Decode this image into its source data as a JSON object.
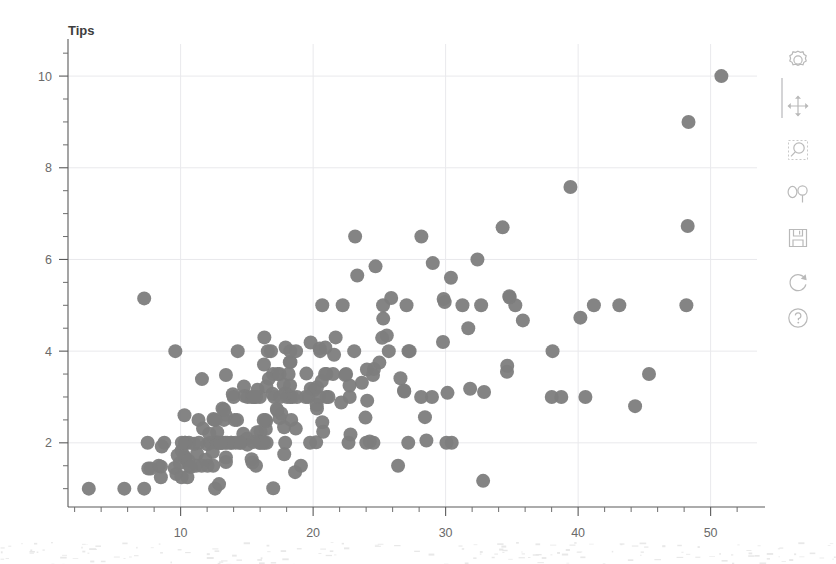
{
  "window": {
    "background_color": "#ffffff"
  },
  "chart_data": {
    "type": "scatter",
    "title": "",
    "ylabel": "Tips",
    "xlabel": "",
    "grid": true,
    "legend": "none",
    "marker": {
      "shape": "circle",
      "color": "#7d7d7d",
      "radius_px": 7
    },
    "xlim": [
      1.5,
      53.5
    ],
    "ylim": [
      0.6,
      10.7
    ],
    "xticks": [
      10,
      20,
      30,
      40,
      50
    ],
    "xtick_labels": [
      "10",
      "20",
      "30",
      "40",
      "50"
    ],
    "x_minor_step": 2,
    "yticks": [
      2,
      4,
      6,
      8,
      10
    ],
    "ytick_labels": [
      "2",
      "4",
      "6",
      "8",
      "10"
    ],
    "y_minor_step": 0.5,
    "series": [
      {
        "name": "tips",
        "x": [
          16.99,
          10.34,
          21.01,
          23.68,
          24.59,
          25.29,
          8.77,
          26.88,
          15.04,
          14.78,
          10.27,
          35.26,
          15.42,
          18.43,
          14.83,
          21.58,
          10.33,
          16.29,
          16.97,
          20.65,
          17.92,
          20.29,
          15.77,
          39.42,
          19.82,
          17.81,
          13.37,
          12.69,
          21.7,
          19.65,
          9.55,
          18.35,
          15.06,
          20.69,
          17.78,
          24.06,
          16.31,
          16.93,
          18.69,
          31.27,
          16.04,
          17.46,
          13.94,
          9.68,
          30.4,
          18.29,
          22.23,
          32.4,
          28.55,
          18.04,
          12.54,
          10.29,
          34.81,
          9.94,
          25.56,
          19.49,
          38.01,
          26.41,
          11.24,
          48.27,
          20.29,
          13.81,
          11.02,
          18.29,
          17.59,
          20.08,
          16.45,
          3.07,
          20.23,
          15.01,
          12.02,
          17.07,
          26.86,
          25.28,
          14.73,
          10.51,
          17.92,
          27.2,
          22.76,
          17.29,
          19.44,
          16.66,
          10.07,
          32.68,
          15.98,
          34.83,
          13.03,
          18.28,
          24.71,
          21.16,
          28.97,
          22.49,
          5.75,
          16.32,
          22.75,
          40.17,
          27.28,
          12.03,
          21.01,
          12.46,
          11.35,
          15.38,
          44.3,
          22.42,
          20.92,
          15.36,
          20.49,
          25.21,
          18.24,
          14.31,
          14.0,
          7.25,
          38.07,
          23.95,
          25.71,
          17.31,
          29.93,
          10.65,
          12.43,
          24.08,
          11.69,
          13.42,
          14.26,
          15.95,
          12.48,
          29.8,
          8.52,
          14.52,
          11.38,
          22.82,
          19.08,
          20.27,
          11.17,
          12.26,
          18.26,
          8.51,
          10.33,
          14.15,
          16.0,
          13.16,
          17.47,
          34.3,
          41.19,
          27.05,
          16.43,
          8.35,
          18.64,
          11.87,
          9.78,
          7.51,
          14.07,
          13.13,
          17.26,
          24.55,
          19.77,
          29.85,
          48.17,
          25.0,
          13.39,
          16.49,
          21.5,
          12.66,
          16.21,
          13.81,
          17.51,
          24.52,
          20.76,
          31.71,
          10.59,
          10.63,
          50.81,
          15.81,
          7.25,
          31.85,
          16.82,
          32.9,
          17.89,
          14.48,
          9.6,
          34.63,
          34.65,
          23.33,
          45.35,
          23.17,
          40.55,
          20.69,
          20.9,
          30.46,
          18.15,
          23.1,
          15.69,
          19.81,
          28.44,
          15.48,
          16.58,
          7.56,
          10.34,
          43.11,
          13.0,
          13.51,
          18.71,
          12.74,
          13.0,
          16.4,
          20.53,
          16.47,
          26.59,
          38.73,
          24.27,
          12.76,
          30.06,
          25.89,
          48.33,
          13.27,
          28.17,
          12.9,
          28.15,
          11.59,
          7.74,
          30.14,
          12.16,
          13.42,
          8.58,
          15.98,
          13.42,
          16.27,
          10.09,
          20.45,
          13.28,
          22.12,
          24.01,
          15.69,
          11.61,
          10.77,
          15.53,
          10.07,
          12.6,
          32.83,
          35.83,
          29.03,
          27.18,
          22.67,
          17.82,
          18.78
        ],
        "y": [
          1.01,
          1.66,
          3.5,
          3.31,
          3.61,
          4.71,
          2.0,
          3.12,
          1.96,
          3.23,
          1.71,
          5.0,
          1.57,
          3.0,
          3.02,
          3.92,
          1.67,
          3.71,
          3.5,
          3.35,
          4.08,
          2.75,
          2.23,
          7.58,
          3.18,
          2.34,
          2.0,
          2.0,
          4.3,
          3.0,
          1.45,
          2.5,
          3.0,
          2.45,
          3.27,
          3.6,
          2.0,
          3.07,
          2.31,
          5.0,
          2.24,
          2.54,
          3.06,
          1.32,
          5.6,
          3.0,
          5.0,
          6.0,
          2.05,
          3.0,
          2.5,
          2.6,
          5.2,
          1.56,
          4.34,
          3.51,
          3.0,
          1.5,
          1.76,
          6.73,
          3.21,
          2.0,
          1.98,
          3.76,
          2.64,
          3.15,
          2.47,
          1.0,
          2.01,
          2.09,
          1.97,
          3.0,
          3.14,
          5.0,
          2.2,
          1.25,
          3.08,
          4.0,
          3.0,
          2.71,
          3.0,
          3.4,
          1.83,
          5.0,
          2.03,
          5.17,
          2.0,
          4.0,
          5.85,
          3.0,
          3.0,
          3.5,
          1.0,
          4.3,
          3.25,
          4.73,
          4.0,
          1.5,
          3.0,
          1.5,
          2.5,
          3.0,
          2.8,
          3.48,
          4.08,
          1.64,
          4.06,
          4.29,
          3.76,
          4.0,
          3.0,
          1.0,
          4.0,
          2.55,
          4.0,
          3.5,
          5.07,
          1.5,
          1.8,
          2.92,
          2.31,
          1.68,
          2.5,
          2.0,
          2.52,
          4.2,
          1.48,
          2.0,
          2.0,
          2.18,
          1.5,
          2.83,
          1.5,
          2.0,
          3.25,
          1.25,
          2.0,
          2.0,
          2.0,
          2.75,
          3.5,
          6.7,
          5.0,
          5.0,
          2.3,
          1.5,
          1.36,
          1.63,
          1.73,
          2.0,
          2.5,
          2.0,
          2.74,
          2.0,
          2.0,
          5.14,
          5.0,
          3.75,
          2.61,
          2.0,
          3.5,
          2.5,
          2.0,
          2.0,
          3.0,
          3.48,
          2.24,
          4.5,
          1.61,
          2.0,
          10.0,
          3.16,
          5.15,
          3.18,
          4.0,
          3.11,
          2.0,
          2.0,
          4.0,
          3.55,
          3.68,
          5.65,
          3.5,
          6.5,
          3.0,
          5.0,
          3.5,
          2.0,
          3.5,
          4.0,
          1.5,
          4.19,
          2.56,
          2.02,
          4.0,
          1.44,
          2.0,
          5.0,
          2.0,
          2.0,
          4.0,
          2.01,
          2.0,
          2.5,
          4.0,
          3.23,
          3.41,
          3.0,
          2.03,
          2.23,
          2.0,
          5.16,
          9.0,
          2.5,
          6.5,
          1.1,
          3.0,
          1.5,
          1.44,
          3.09,
          2.2,
          3.48,
          1.92,
          3.0,
          1.58,
          2.5,
          2.0,
          3.0,
          2.72,
          2.88,
          2.0,
          3.0,
          3.39,
          1.47,
          3.0,
          1.25,
          1.0,
          1.17,
          4.67,
          5.92,
          2.0,
          2.0,
          1.75,
          3.0
        ]
      }
    ]
  },
  "toolbar": {
    "items": [
      {
        "name": "settings-icon",
        "label": "Settings"
      },
      {
        "name": "move-icon",
        "label": "Pan"
      },
      {
        "name": "zoom-region-icon",
        "label": "Zoom to region"
      },
      {
        "name": "zoom-in-out-icon",
        "label": "Zoom in / out"
      },
      {
        "name": "save-icon",
        "label": "Save"
      },
      {
        "name": "refresh-icon",
        "label": "Reset view"
      },
      {
        "name": "help-icon",
        "label": "Help"
      }
    ]
  }
}
